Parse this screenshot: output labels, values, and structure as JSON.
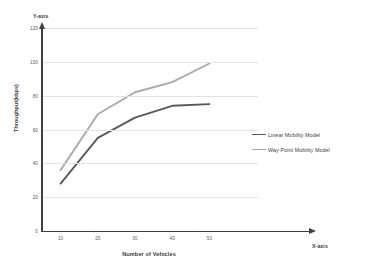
{
  "chart_data": {
    "type": "line",
    "title": "",
    "xlabel": "Number of Vehicles",
    "ylabel": "Throughput(kbps)",
    "x_axis_end_label": "X-axis",
    "y_axis_end_label": "Y-axis",
    "x": [
      10,
      20,
      30,
      40,
      50
    ],
    "xticks": [
      "10",
      "20",
      "30",
      "40",
      "50"
    ],
    "yticks": [
      "0",
      "20",
      "40",
      "60",
      "80",
      "100",
      "120"
    ],
    "xlim": [
      5,
      55
    ],
    "ylim": [
      0,
      120
    ],
    "grid": "horizontal",
    "legend_position": "right",
    "series": [
      {
        "name": "Linear Mobility Model",
        "color": "#595959",
        "values": [
          28,
          55,
          67,
          74,
          75
        ]
      },
      {
        "name": "Way-Point Mobility Model",
        "color": "#aaaaaa",
        "values": [
          36,
          69,
          82,
          88,
          99
        ]
      }
    ]
  },
  "colors": {
    "axis": "#404040",
    "gridline": "#e3e3e3",
    "text": "#3f3f3f",
    "background": "#ffffff"
  }
}
